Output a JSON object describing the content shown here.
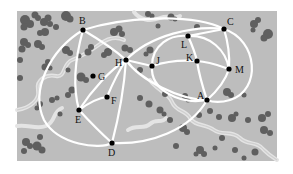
{
  "diagram": {
    "type": "graph-on-map",
    "panel": {
      "x": 17,
      "y": 11,
      "w": 260,
      "h": 150,
      "color": "#bdbdbd"
    },
    "colors": {
      "background": "#ffffff",
      "panel": "#bdbdbd",
      "tree": "#5f5f5f",
      "road": "#ffffff",
      "stream": "#e6e6e6",
      "node": "#000000",
      "label": "#111111"
    },
    "nodes": [
      {
        "id": "A",
        "label": "A",
        "x": 207,
        "y": 100,
        "lx": -10,
        "ly": -1
      },
      {
        "id": "B",
        "label": "B",
        "x": 83,
        "y": 30,
        "lx": -4,
        "ly": -6
      },
      {
        "id": "C",
        "label": "C",
        "x": 224,
        "y": 29,
        "lx": 3,
        "ly": -4
      },
      {
        "id": "D",
        "label": "D",
        "x": 112,
        "y": 143,
        "lx": -4,
        "ly": 13
      },
      {
        "id": "E",
        "label": "E",
        "x": 79,
        "y": 110,
        "lx": -4,
        "ly": 13
      },
      {
        "id": "F",
        "label": "F",
        "x": 107,
        "y": 97,
        "lx": 4,
        "ly": 7
      },
      {
        "id": "G",
        "label": "G",
        "x": 93,
        "y": 76,
        "lx": 5,
        "ly": 4
      },
      {
        "id": "H",
        "label": "H",
        "x": 126,
        "y": 60,
        "lx": -11,
        "ly": 6
      },
      {
        "id": "J",
        "label": "J",
        "x": 152,
        "y": 66,
        "lx": 4,
        "ly": -2
      },
      {
        "id": "K",
        "label": "K",
        "x": 197,
        "y": 61,
        "lx": -11,
        "ly": 0
      },
      {
        "id": "L",
        "label": "L",
        "x": 188,
        "y": 36,
        "lx": -7,
        "ly": 12
      },
      {
        "id": "M",
        "label": "M",
        "x": 229,
        "y": 69,
        "lx": 6,
        "ly": 4
      }
    ]
  }
}
